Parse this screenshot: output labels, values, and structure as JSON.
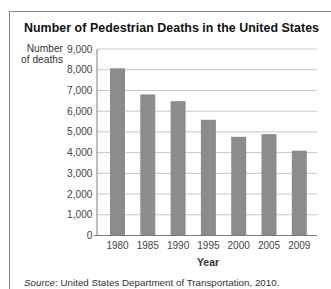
{
  "figure": {
    "title": "Number of Pedestrian Deaths in the United States",
    "ylabel_line1": "Number",
    "ylabel_line2": "of deaths",
    "xlabel": "Year",
    "source_label": "Source",
    "source_text": ": United States Department of Transportation, 2010."
  },
  "chart_data": {
    "type": "bar",
    "title": "Number of Pedestrian Deaths in the United States",
    "xlabel": "Year",
    "ylabel": "Number of deaths",
    "categories": [
      "1980",
      "1985",
      "1990",
      "1995",
      "2000",
      "2005",
      "2009"
    ],
    "values": [
      8070,
      6808,
      6482,
      5584,
      4763,
      4892,
      4092
    ],
    "ylim": [
      0,
      9000
    ],
    "yticks": [
      0,
      1000,
      2000,
      3000,
      4000,
      5000,
      6000,
      7000,
      8000,
      9000
    ],
    "ytick_labels": [
      "0",
      "1,000",
      "2,000",
      "3,000",
      "4,000",
      "5,000",
      "6,000",
      "7,000",
      "8,000",
      "9,000"
    ],
    "grid": true,
    "legend": null,
    "source": "Source: United States Department of Transportation, 2010.",
    "colors": {
      "bar": "#8c8c8c",
      "grid": "#c6c6c6",
      "axis": "#7a7a7a",
      "tick_text": "#444444"
    }
  }
}
